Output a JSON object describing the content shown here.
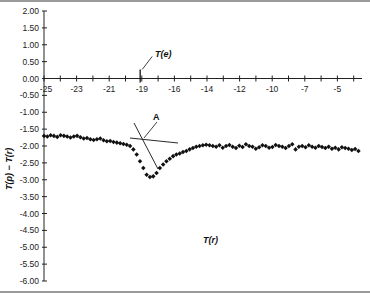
{
  "chart_data": {
    "type": "scatter",
    "title": "",
    "xlabel": "T(r)",
    "ylabel": "T(p) − T(r)",
    "ylim": [
      -6.0,
      2.0
    ],
    "y_ticks": [
      "2.00",
      "1.50",
      "1.00",
      "0.50",
      "0.00",
      "-0.50",
      "-1.00",
      "-1.50",
      "-2.00",
      "-2.50",
      "-3.00",
      "-3.50",
      "-4.00",
      "-4.50",
      "-5.00",
      "-5.50",
      "-6.00"
    ],
    "x_tick_labels": [
      "-25",
      "-23",
      "-21",
      "-19",
      "-16",
      "-14",
      "-12",
      "-10",
      "-7",
      "-5"
    ],
    "x_range_index": [
      0,
      19.5
    ],
    "grid": false,
    "legend": null,
    "annotations": [
      {
        "label": "T(e)",
        "x_index": 5,
        "description": "vertical marker on x-axis at -19 region"
      },
      {
        "label": "A",
        "description": "intersection of two tangent lines near onset of dip"
      }
    ],
    "series": [
      {
        "name": "T(p) - T(r)",
        "marker": "diamond",
        "x_index": [
          0.0,
          0.2,
          0.4,
          0.6,
          0.8,
          1.0,
          1.2,
          1.4,
          1.6,
          1.8,
          2.0,
          2.2,
          2.4,
          2.6,
          2.8,
          3.0,
          3.2,
          3.4,
          3.6,
          3.8,
          4.0,
          4.2,
          4.4,
          4.6,
          4.8,
          5.0,
          5.2,
          5.4,
          5.6,
          5.8,
          6.0,
          6.2,
          6.4,
          6.6,
          6.8,
          7.0,
          7.2,
          7.4,
          7.6,
          7.8,
          8.0,
          8.2,
          8.4,
          8.6,
          8.8,
          9.0,
          9.2,
          9.4,
          9.6,
          9.8,
          10.0,
          10.2,
          10.4,
          10.6,
          10.8,
          11.0,
          11.2,
          11.4,
          11.6,
          11.8,
          12.0,
          12.2,
          12.4,
          12.6,
          12.8,
          13.0,
          13.2,
          13.4,
          13.6,
          13.8,
          14.0,
          14.2,
          14.4,
          14.6,
          14.8,
          15.0,
          15.2,
          15.4,
          15.6,
          15.8,
          16.0,
          16.2,
          16.4,
          16.6,
          16.8,
          17.0,
          17.2,
          17.4,
          17.6,
          17.8,
          18.0,
          18.2,
          18.4,
          18.6,
          18.8,
          19.0
        ],
        "y": [
          -1.7,
          -1.72,
          -1.68,
          -1.7,
          -1.73,
          -1.68,
          -1.7,
          -1.72,
          -1.75,
          -1.72,
          -1.7,
          -1.74,
          -1.78,
          -1.76,
          -1.8,
          -1.82,
          -1.8,
          -1.78,
          -1.83,
          -1.86,
          -1.85,
          -1.88,
          -1.9,
          -1.92,
          -1.94,
          -1.96,
          -2.0,
          -2.1,
          -2.25,
          -2.45,
          -2.65,
          -2.85,
          -2.92,
          -2.9,
          -2.8,
          -2.65,
          -2.55,
          -2.45,
          -2.38,
          -2.3,
          -2.25,
          -2.22,
          -2.18,
          -2.15,
          -2.1,
          -2.06,
          -2.02,
          -2.0,
          -1.98,
          -1.96,
          -1.98,
          -2.0,
          -2.02,
          -1.98,
          -2.05,
          -2.0,
          -1.97,
          -2.02,
          -2.06,
          -1.99,
          -2.03,
          -1.95,
          -2.0,
          -2.02,
          -2.08,
          -2.04,
          -1.98,
          -2.0,
          -2.05,
          -2.03,
          -1.97,
          -2.0,
          -2.02,
          -2.06,
          -2.0,
          -1.95,
          -2.1,
          -2.02,
          -2.0,
          -2.04,
          -1.98,
          -2.02,
          -2.05,
          -2.0,
          -2.03,
          -2.06,
          -2.02,
          -2.08,
          -2.05,
          -2.1,
          -2.04,
          -2.06,
          -2.08,
          -2.12,
          -2.09,
          -2.15
        ]
      }
    ]
  },
  "axes": {
    "x_title": "T(r)",
    "y_title": "T(p) − T(r)"
  },
  "annotations": {
    "te_label": "T(e)",
    "a_label": "A"
  }
}
